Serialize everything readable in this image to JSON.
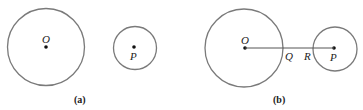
{
  "figures": [
    {
      "caption": "(a)",
      "circles": [
        {
          "label": "O",
          "cx": 46,
          "cy": 47,
          "r": 38.5
        },
        {
          "label": "P",
          "cx": 135,
          "cy": 48,
          "r": 21.5
        }
      ]
    },
    {
      "caption": "(b)",
      "circles": [
        {
          "label": "O",
          "cx": 244,
          "cy": 48,
          "r": 39
        },
        {
          "label": "P",
          "cx": 335,
          "cy": 49,
          "r": 22
        }
      ],
      "segment": {
        "from": "O",
        "to": "P"
      },
      "points": [
        {
          "label": "Q"
        },
        {
          "label": "R"
        }
      ]
    }
  ],
  "colors": {
    "stroke": "#777777",
    "ink": "#111111"
  }
}
